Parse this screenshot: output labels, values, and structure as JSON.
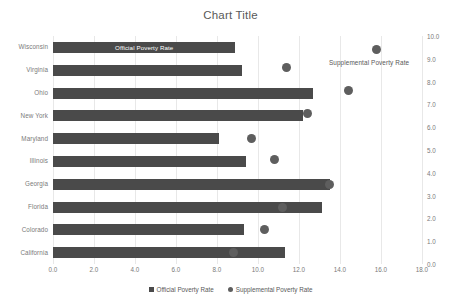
{
  "chart_data": {
    "type": "bar",
    "title": "Chart Title",
    "xlabel": "",
    "ylabel": "",
    "orientation": "horizontal",
    "grid": true,
    "legend_position": "bottom",
    "categories": [
      "California",
      "Colorado",
      "Florida",
      "Georgia",
      "Illinois",
      "Maryland",
      "New York",
      "Ohio",
      "Virginia",
      "Wisconsin"
    ],
    "categories_top_to_bottom": [
      "Wisconsin",
      "Virginia",
      "Ohio",
      "New York",
      "Maryland",
      "Illinois",
      "Georgia",
      "Florida",
      "Colorado",
      "California"
    ],
    "xlim": [
      0.0,
      18.0
    ],
    "xticks": [
      "0.0",
      "2.0",
      "4.0",
      "6.0",
      "8.0",
      "10.0",
      "12.0",
      "14.0",
      "16.0",
      "18.0"
    ],
    "xtick_values": [
      0,
      2,
      4,
      6,
      8,
      10,
      12,
      14,
      16,
      18
    ],
    "secondary_ylim": [
      0.0,
      10.0
    ],
    "secondary_yticks": [
      "0.0",
      "1.0",
      "2.0",
      "3.0",
      "4.0",
      "5.0",
      "6.0",
      "7.0",
      "8.0",
      "9.0",
      "10.0"
    ],
    "secondary_ytick_values": [
      0,
      1,
      2,
      3,
      4,
      5,
      6,
      7,
      8,
      9,
      10
    ],
    "series": [
      {
        "name": "Official Poverty Rate",
        "type": "bar",
        "axis": "primary-x",
        "color": "#4a4a4a",
        "values_top_to_bottom": [
          8.9,
          9.2,
          12.7,
          12.2,
          8.1,
          9.4,
          13.5,
          13.1,
          9.3,
          11.3
        ]
      },
      {
        "name": "Supplemental Poverty Rate",
        "type": "scatter",
        "axis": "secondary-y",
        "color": "#5e5e5e",
        "x_values_top_to_bottom": [
          15.8,
          11.4,
          14.4,
          12.4,
          9.7,
          10.8,
          13.5,
          11.2,
          10.3,
          8.8
        ],
        "secondary_values_top_to_bottom": [
          9.4,
          8.6,
          7.6,
          6.6,
          5.5,
          4.6,
          3.5,
          2.5,
          1.5,
          0.5
        ]
      }
    ],
    "annotations": [
      {
        "name": "bar-series-label",
        "text": "Official Poverty Rate",
        "on": "Wisconsin"
      },
      {
        "name": "scatter-series-label",
        "text": "Supplemental Poverty Rate",
        "near": "Wisconsin"
      }
    ]
  },
  "legend": {
    "items": [
      {
        "label": "Official Poverty Rate",
        "marker": "square",
        "color": "#4a4a4a"
      },
      {
        "label": "Supplemental Poverty Rate",
        "marker": "dot",
        "color": "#5e5e5e"
      }
    ]
  },
  "colors": {
    "bar": "#4a4a4a",
    "dot": "#5e5e5e",
    "grid": "#e8e8e8",
    "text": "#595959",
    "tick_text": "#7a7a7a",
    "background": "#ffffff"
  }
}
